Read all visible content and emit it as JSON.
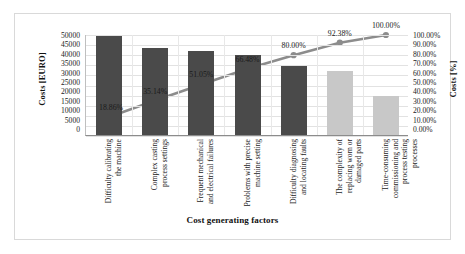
{
  "chart_data": {
    "type": "bar",
    "title": "",
    "subtitle": "",
    "xlabel": "Cost generating factors",
    "ylabel": "Costs [EURO]",
    "y2label": "Costs [%]",
    "ylim": [
      0,
      50000
    ],
    "y2lim": [
      0,
      1.0
    ],
    "grid": true,
    "legend": "none",
    "categories": [
      "Difficulty calibrating the machine",
      "Complex casting process settings",
      "Frequent mechanical and electrical failures",
      "Problems with precise machine setting",
      "Difficulty diagnosing and locating faults",
      "The complexity of replacing worn or damaged parts",
      "Time-consuming commissioning and process testing processes"
    ],
    "category_lines": [
      [
        "Difficulty calibrating",
        "the machine"
      ],
      [
        "Complex casting",
        "process settings"
      ],
      [
        "Frequent mechanical",
        "and electrical failures"
      ],
      [
        "Problems with precise",
        "machine setting"
      ],
      [
        "Difficulty diagnosing",
        "and locating faults"
      ],
      [
        "The complexity of",
        "replacing worn or",
        "damaged parts"
      ],
      [
        "Time-consuming",
        "commissioning and",
        "process testing",
        "processes"
      ]
    ],
    "series": [
      {
        "name": "Costs [EURO]",
        "type": "bar",
        "values": [
          49000,
          43000,
          41500,
          39500,
          34000,
          31500,
          19500
        ],
        "colors": [
          "#4a4a4a",
          "#4a4a4a",
          "#4a4a4a",
          "#4a4a4a",
          "#4a4a4a",
          "#c8c8c8",
          "#c8c8c8"
        ]
      },
      {
        "name": "Cumulative [%]",
        "type": "line",
        "values": [
          18.86,
          35.14,
          51.05,
          66.48,
          80.0,
          92.38,
          100.0
        ],
        "labels": [
          "18.86%",
          "35.14%",
          "51.05%",
          "66.48%",
          "80.00%",
          "92.38%",
          "100.00%"
        ],
        "color": "#8c8c8c"
      }
    ],
    "y_ticks": [
      "50000",
      "45000",
      "40000",
      "35000",
      "30000",
      "25000",
      "20000",
      "15000",
      "10000",
      "5000",
      "0"
    ],
    "y2_ticks": [
      "100.00%",
      "90.00%",
      "80.00%",
      "70.00%",
      "60.00%",
      "50.00%",
      "40.00%",
      "30.00%",
      "20.00%",
      "10.00%",
      "0.00%"
    ]
  },
  "colors": {
    "bar_dark": "#4a4a4a",
    "bar_light": "#c8c8c8",
    "line": "#8c8c8c",
    "frame": "#d9d9d9",
    "grid": "#e2e2e2"
  }
}
